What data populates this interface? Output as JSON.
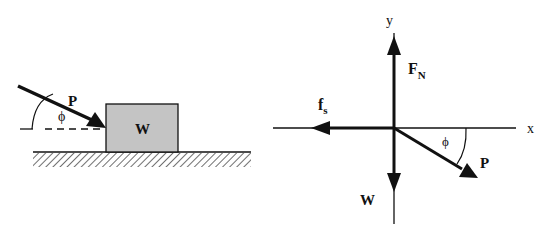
{
  "left_diagram": {
    "force_label": "P",
    "angle_label": "ϕ",
    "block_label": "W",
    "block_color": "#c4c4c4"
  },
  "free_body_diagram": {
    "x_axis_label": "x",
    "y_axis_label": "y",
    "normal_force": {
      "label": "F",
      "subscript": "N"
    },
    "friction_force": {
      "label": "f",
      "subscript": "s"
    },
    "weight_label": "W",
    "applied_force_label": "P",
    "angle_label": "ϕ"
  }
}
